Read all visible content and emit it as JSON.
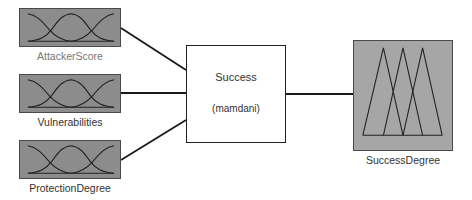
{
  "system": {
    "name": "Success",
    "type": "(mamdani)"
  },
  "inputs": [
    {
      "label": "AttackerScore",
      "mf_shape": "gaussian",
      "mf_count": 3
    },
    {
      "label": "Vulnerabilities",
      "mf_shape": "gaussian",
      "mf_count": 3
    },
    {
      "label": "ProtectionDegree",
      "mf_shape": "gaussian",
      "mf_count": 3
    }
  ],
  "output": {
    "label": "SuccessDegree",
    "mf_shape": "triangular",
    "mf_count": 3
  },
  "colors": {
    "input_box": "#8c8c8c",
    "output_box": "#a6a6a6",
    "lines": "#1a1a1a"
  }
}
